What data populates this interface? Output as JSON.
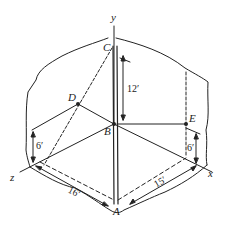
{
  "diagram": {
    "type": "3d-axes-tension-pole",
    "axes": {
      "x": "x",
      "y": "y",
      "z": "z"
    },
    "points": {
      "A": "A",
      "B": "B",
      "C": "C",
      "D": "D",
      "E": "E"
    },
    "dimensions": {
      "pole_height": "12′",
      "left_wall_height": "6′",
      "right_wall_height": "6′",
      "z_distance": "16′",
      "x_distance": "15′"
    },
    "colors": {
      "line": "#222222",
      "background": "#ffffff"
    }
  }
}
